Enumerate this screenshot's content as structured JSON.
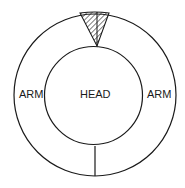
{
  "diagram": {
    "labels": {
      "left": "ARM",
      "center": "HEAD",
      "right": "ARM"
    },
    "colors": {
      "stroke": "#1a1a1a",
      "background": "#ffffff"
    }
  }
}
